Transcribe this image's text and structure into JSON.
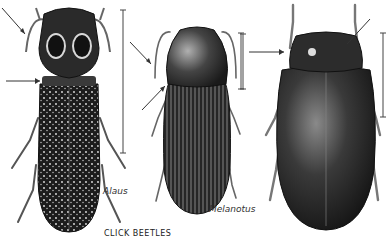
{
  "figure": {
    "caption": "CLICK BEETLES",
    "specimens": [
      {
        "name": "Alaus",
        "label": "Alaus"
      },
      {
        "name": "Melanotus",
        "label": "Melanotus"
      },
      {
        "name": "unlabeled-beetle",
        "label": ""
      }
    ]
  }
}
